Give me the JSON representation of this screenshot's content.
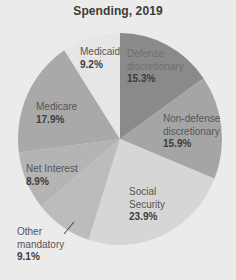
{
  "chart_data": {
    "type": "pie",
    "title": "Spending, 2019",
    "start_angle_deg": 0,
    "direction": "clockwise",
    "slices": [
      {
        "label": "Defense discretionary",
        "value": 15.3,
        "color": "#8a8a8a"
      },
      {
        "label": "Non-defense discretionary",
        "value": 15.9,
        "color": "#a5a5a5"
      },
      {
        "label": "Social Security",
        "value": 23.9,
        "color": "#d6d6d6"
      },
      {
        "label": "Other mandatory",
        "value": 9.1,
        "color": "#bcbcbc"
      },
      {
        "label": "Net Interest",
        "value": 8.9,
        "color": "#b4b4b4"
      },
      {
        "label": "Medicare",
        "value": 17.9,
        "color": "#a9a9a9"
      },
      {
        "label": "Medicaid",
        "value": 9.2,
        "color": "#e6e6e6"
      }
    ],
    "legend": "none (direct labels)"
  },
  "labels": {
    "defense": {
      "line1": "Defense",
      "line2": "discretionary",
      "pct": "15.3%"
    },
    "nondefense": {
      "line1": "Non-defense",
      "line2": "discretionary",
      "pct": "15.9%"
    },
    "social_security": {
      "line1": "Social",
      "line2": "Security",
      "pct": "23.9%"
    },
    "other_mandatory": {
      "line1": "Other",
      "line2": "mandatory",
      "pct": "9.1%"
    },
    "net_interest": {
      "line1": "Net Interest",
      "pct": "8.9%"
    },
    "medicare": {
      "line1": "Medicare",
      "pct": "17.9%"
    },
    "medicaid": {
      "line1": "Medicaid",
      "pct": "9.2%"
    }
  }
}
